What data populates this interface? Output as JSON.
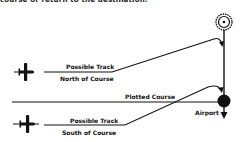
{
  "caption_fragment": "course or return to the destination.",
  "labels": {
    "north_track_line1": "Possible Track",
    "north_track_line2": "North of Course",
    "plotted_course": "Plotted Course",
    "south_track_line1": "Possible Track",
    "south_track_line2": "South of Course",
    "airport": "Airport"
  },
  "icons": {
    "vor_station": "vor-icon",
    "airport": "airport-dot-icon",
    "aircraft_north": "airplane-icon",
    "aircraft_south": "airplane-icon"
  },
  "colors": {
    "ink": "#111111",
    "background": "#ffffff"
  }
}
